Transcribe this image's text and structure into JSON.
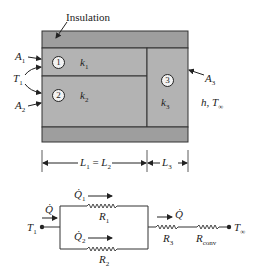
{
  "figure": {
    "top_label": "Insulation",
    "colors": {
      "insulation": "#9e9e9e",
      "layer_fill": "#b3b3b3",
      "lines": "#333333",
      "text": "#222222",
      "background": "#ffffff"
    },
    "layers": [
      {
        "id": "1",
        "conductivity": "k",
        "conductivity_sub": "1"
      },
      {
        "id": "2",
        "conductivity": "k",
        "conductivity_sub": "2"
      },
      {
        "id": "3",
        "conductivity": "k",
        "conductivity_sub": "3"
      }
    ],
    "areas": [
      {
        "label": "A",
        "sub": "1"
      },
      {
        "label": "A",
        "sub": "2"
      },
      {
        "label": "A",
        "sub": "3"
      }
    ],
    "temperature_left": {
      "label": "T",
      "sub": "1"
    },
    "convection": {
      "label": "h, T",
      "sub": "∞"
    },
    "dimensions": [
      {
        "label": "L",
        "sub": "1",
        "eq": " = ",
        "label2": "L",
        "sub2": "2"
      },
      {
        "label": "L",
        "sub": "3"
      }
    ]
  },
  "circuit": {
    "node_left": {
      "label": "T",
      "sub": "1"
    },
    "node_right": {
      "label": "T",
      "sub": "∞"
    },
    "heat_total": {
      "label": "Q̇"
    },
    "heat_total_right": {
      "label": "Q̇"
    },
    "branches": [
      {
        "heat": "Q̇",
        "heat_sub": "1",
        "resistor": "R",
        "resistor_sub": "1"
      },
      {
        "heat": "Q̇",
        "heat_sub": "2",
        "resistor": "R",
        "resistor_sub": "2"
      }
    ],
    "series": [
      {
        "resistor": "R",
        "resistor_sub": "3"
      },
      {
        "resistor": "R",
        "resistor_sub": "conv"
      }
    ]
  }
}
